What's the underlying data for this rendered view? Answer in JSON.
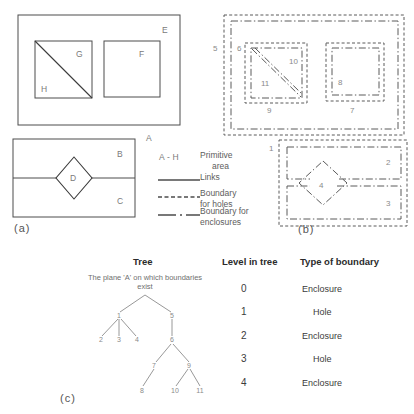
{
  "figure": {
    "title_panels": [
      "(a)",
      "(b)",
      "(c)"
    ],
    "panel_a": {
      "caption": "(a)",
      "plane_label": "A",
      "top_region": {
        "outer_label": "E",
        "left_square": {
          "upper_label": "G",
          "lower_label": "H",
          "split": "diagonal"
        },
        "right_square": {
          "label": "F"
        }
      },
      "bottom_region": {
        "upper_label": "B",
        "lower_label": "C",
        "diamond_label": "D",
        "split": "horizontal"
      }
    },
    "legend": {
      "items": [
        {
          "key": "A - H",
          "style": "text",
          "label": "Primitive\narea",
          "line1": "Primitive",
          "line2": "area"
        },
        {
          "key": "",
          "style": "solid",
          "label": "Links",
          "line1": "Links",
          "line2": ""
        },
        {
          "key": "",
          "style": "dashed",
          "label": "Boundary for holes",
          "line1": "Boundary",
          "line2": "for holes"
        },
        {
          "key": "",
          "style": "dash-dot",
          "label": "Boundary for enclosures",
          "line1": "Boundary for",
          "line2": "enclosures"
        }
      ]
    },
    "panel_b": {
      "caption": "(b)",
      "top_region_numbers": [
        "5",
        "6",
        "9",
        "10",
        "11",
        "7",
        "8"
      ],
      "bottom_region_numbers": [
        "1",
        "2",
        "3",
        "4"
      ],
      "labels": {
        "n1": "1",
        "n2": "2",
        "n3": "3",
        "n4": "4",
        "n5": "5",
        "n6": "6",
        "n7": "7",
        "n8": "8",
        "n9": "9",
        "n10": "10",
        "n11": "11"
      }
    },
    "panel_c": {
      "caption": "(c)",
      "columns": [
        "Tree",
        "Level in tree",
        "Type of boundary"
      ],
      "tree_caption": "The plane 'A' on which boundaries exist",
      "tree": {
        "root": "plane-A",
        "nodes": [
          "1",
          "2",
          "3",
          "4",
          "5",
          "6",
          "7",
          "8",
          "9",
          "10",
          "11"
        ],
        "edges": [
          [
            "root",
            "1"
          ],
          [
            "root",
            "5"
          ],
          [
            "1",
            "2"
          ],
          [
            "1",
            "3"
          ],
          [
            "1",
            "4"
          ],
          [
            "5",
            "6"
          ],
          [
            "6",
            "7"
          ],
          [
            "6",
            "9"
          ],
          [
            "7",
            "8"
          ],
          [
            "9",
            "10"
          ],
          [
            "9",
            "11"
          ]
        ]
      },
      "rows": [
        {
          "level": "0",
          "type": "Enclosure"
        },
        {
          "level": "1",
          "type": "Hole"
        },
        {
          "level": "2",
          "type": "Enclosure"
        },
        {
          "level": "3",
          "type": "Hole"
        },
        {
          "level": "4",
          "type": "Enclosure"
        }
      ]
    },
    "colors": {
      "background": "#ffffff",
      "line": "#4c4c4c",
      "label": "#7a7a7a",
      "text": "#3b3b3b"
    }
  }
}
